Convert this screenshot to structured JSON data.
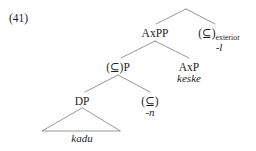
{
  "figure": {
    "example_number": "(41)",
    "type": "syntactic-tree-diagram",
    "background_color": "#ffffff",
    "line_color": "#8a8a8a",
    "text_color": "#1d1d1d"
  },
  "tree": {
    "root": {
      "name": "root-node",
      "label": "",
      "x": 186,
      "y": 9
    },
    "nodes": [
      {
        "name": "axpp-node",
        "category": "AxPP",
        "terminal": "",
        "subscript": "",
        "x": 155,
        "y": 27
      },
      {
        "name": "subset-exterior-node",
        "category": "(⊆)",
        "subscript": "exterior",
        "terminal": "-l",
        "x": 219,
        "y": 27
      },
      {
        "name": "subset-p-node",
        "category": "(⊆)P",
        "subscript": "",
        "terminal": "",
        "x": 118,
        "y": 61
      },
      {
        "name": "axp-node",
        "category": "AxP",
        "subscript": "",
        "terminal": "keske",
        "x": 189,
        "y": 61
      },
      {
        "name": "dp-node",
        "category": "DP",
        "subscript": "",
        "terminal": "",
        "x": 82,
        "y": 95
      },
      {
        "name": "subset-n-node",
        "category": "(⊆)",
        "subscript": "",
        "terminal": "-n",
        "x": 150,
        "y": 95
      }
    ],
    "triangle": {
      "name": "dp-expansion-triangle",
      "terminal": "kadu",
      "apex_x": 82,
      "apex_y": 108,
      "base_left_x": 42,
      "base_right_x": 120,
      "base_y": 131,
      "terminal_y": 133
    },
    "branches": [
      {
        "name": "branch-root-to-axpp",
        "x1": 186,
        "y1": 9,
        "x2": 156,
        "y2": 24
      },
      {
        "name": "branch-root-to-subset-exterior",
        "x1": 186,
        "y1": 9,
        "x2": 215,
        "y2": 24
      },
      {
        "name": "branch-axpp-to-subset-p",
        "x1": 155,
        "y1": 41,
        "x2": 121,
        "y2": 58
      },
      {
        "name": "branch-axpp-to-axp",
        "x1": 155,
        "y1": 41,
        "x2": 189,
        "y2": 58
      },
      {
        "name": "branch-subset-p-to-dp",
        "x1": 118,
        "y1": 75,
        "x2": 85,
        "y2": 92
      },
      {
        "name": "branch-subset-p-to-subset-n",
        "x1": 118,
        "y1": 75,
        "x2": 150,
        "y2": 92
      }
    ]
  }
}
